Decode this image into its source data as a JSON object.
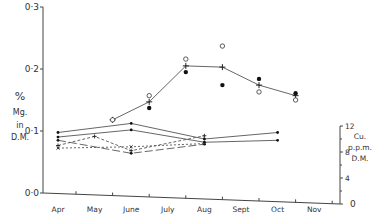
{
  "chart_data": {
    "type": "line",
    "title": "",
    "xlabel": "",
    "categories": [
      "Apr",
      "May",
      "June",
      "July",
      "Aug",
      "Sept",
      "Oct",
      "Nov"
    ],
    "left_axis": {
      "label_lines": [
        "%",
        "Mg.",
        "in",
        "D.M."
      ],
      "ticks": [
        "0·0",
        "0·1",
        "0·2",
        "0·3"
      ],
      "ylim": [
        0,
        0.3
      ]
    },
    "right_axis": {
      "label_lines": [
        "Cu.",
        "p.p.m.",
        "D.M."
      ],
      "ticks": [
        "0",
        "4",
        "8",
        "12"
      ],
      "ylim": [
        0,
        12
      ]
    },
    "series": [
      {
        "name": "Mg mean",
        "axis": "left",
        "marker": "plus",
        "style": "solid",
        "x": [
          "May",
          "June",
          "July",
          "Aug",
          "Sept",
          "Oct"
        ],
        "values": [
          0.118,
          0.147,
          0.205,
          0.203,
          0.174,
          0.157
        ]
      },
      {
        "name": "Mg open circles",
        "axis": "left",
        "marker": "open-circle",
        "style": "none",
        "x": [
          "May",
          "June",
          "July",
          "Aug",
          "Sept",
          "Oct"
        ],
        "values": [
          0.118,
          0.157,
          0.216,
          0.237,
          0.163,
          0.15
        ]
      },
      {
        "name": "Mg filled dots",
        "axis": "left",
        "marker": "dot",
        "style": "none",
        "x": [
          "June",
          "July",
          "Aug",
          "Sept",
          "Oct"
        ],
        "values": [
          0.137,
          0.195,
          0.174,
          0.184,
          0.161
        ]
      },
      {
        "name": "Cu series 1",
        "axis": "right",
        "marker": "dot",
        "style": "solid",
        "x": [
          "Apr",
          "June",
          "Aug",
          "Oct"
        ],
        "values": [
          11.0,
          12.4,
          10.0,
          11.0
        ]
      },
      {
        "name": "Cu series 2",
        "axis": "right",
        "marker": "dot",
        "style": "solid",
        "x": [
          "Apr",
          "June",
          "Aug",
          "Oct"
        ],
        "values": [
          10.3,
          11.4,
          9.5,
          9.8
        ]
      },
      {
        "name": "Cu series 3",
        "axis": "right",
        "marker": "cross",
        "style": "dashed",
        "x": [
          "Apr",
          "May",
          "June",
          "Aug"
        ],
        "values": [
          9.0,
          10.4,
          8.2,
          10.5
        ]
      },
      {
        "name": "Cu series 4",
        "axis": "right",
        "marker": "dot",
        "style": "long-dash",
        "x": [
          "Apr",
          "June",
          "Aug"
        ],
        "values": [
          9.8,
          7.8,
          9.2
        ]
      },
      {
        "name": "Cu series 5",
        "axis": "right",
        "marker": "x",
        "style": "short-dash",
        "x": [
          "Apr",
          "June",
          "Aug"
        ],
        "values": [
          8.6,
          8.8,
          9.3
        ]
      }
    ],
    "grid": false,
    "legend": null
  }
}
